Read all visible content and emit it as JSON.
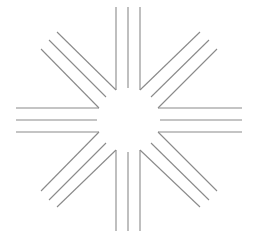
{
  "figure": {
    "width": 254,
    "height": 244,
    "background": "#ffffff",
    "stroke_color": "#8a8a8a",
    "stroke_width": 1.1
  },
  "rays": [
    {
      "name": "ray-top",
      "lines": [
        {
          "x1": 116,
          "y1": 7,
          "x2": 116,
          "y2": 90
        },
        {
          "x1": 128,
          "y1": 7,
          "x2": 128,
          "y2": 88
        },
        {
          "x1": 140,
          "y1": 7,
          "x2": 140,
          "y2": 90
        }
      ]
    },
    {
      "name": "ray-bottom",
      "lines": [
        {
          "x1": 116,
          "y1": 150,
          "x2": 116,
          "y2": 231
        },
        {
          "x1": 128,
          "y1": 152,
          "x2": 128,
          "y2": 231
        },
        {
          "x1": 140,
          "y1": 150,
          "x2": 140,
          "y2": 231
        }
      ]
    },
    {
      "name": "ray-left",
      "lines": [
        {
          "x1": 16,
          "y1": 108,
          "x2": 99,
          "y2": 108
        },
        {
          "x1": 16,
          "y1": 120,
          "x2": 97,
          "y2": 120
        },
        {
          "x1": 16,
          "y1": 132,
          "x2": 99,
          "y2": 132
        }
      ]
    },
    {
      "name": "ray-right",
      "lines": [
        {
          "x1": 158,
          "y1": 108,
          "x2": 242,
          "y2": 108
        },
        {
          "x1": 160,
          "y1": 120,
          "x2": 242,
          "y2": 120
        },
        {
          "x1": 158,
          "y1": 132,
          "x2": 242,
          "y2": 132
        }
      ]
    },
    {
      "name": "ray-top-left",
      "lines": [
        {
          "x1": 57,
          "y1": 32,
          "x2": 116,
          "y2": 90
        },
        {
          "x1": 49,
          "y1": 40,
          "x2": 106,
          "y2": 97
        },
        {
          "x1": 41,
          "y1": 49,
          "x2": 99,
          "y2": 108
        }
      ]
    },
    {
      "name": "ray-top-right",
      "lines": [
        {
          "x1": 200,
          "y1": 32,
          "x2": 140,
          "y2": 90
        },
        {
          "x1": 209,
          "y1": 40,
          "x2": 151,
          "y2": 97
        },
        {
          "x1": 217,
          "y1": 49,
          "x2": 158,
          "y2": 108
        }
      ]
    },
    {
      "name": "ray-bottom-left",
      "lines": [
        {
          "x1": 99,
          "y1": 132,
          "x2": 41,
          "y2": 191
        },
        {
          "x1": 106,
          "y1": 143,
          "x2": 49,
          "y2": 200
        },
        {
          "x1": 116,
          "y1": 150,
          "x2": 57,
          "y2": 207
        }
      ]
    },
    {
      "name": "ray-bottom-right",
      "lines": [
        {
          "x1": 158,
          "y1": 132,
          "x2": 217,
          "y2": 191
        },
        {
          "x1": 151,
          "y1": 143,
          "x2": 209,
          "y2": 200
        },
        {
          "x1": 140,
          "y1": 150,
          "x2": 200,
          "y2": 207
        }
      ]
    }
  ]
}
